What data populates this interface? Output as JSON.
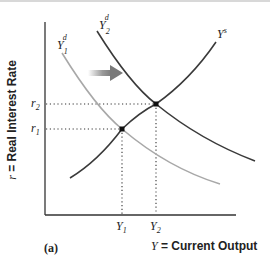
{
  "figure": {
    "panel_label": "(a)",
    "y_axis": {
      "symbol": "r",
      "label": " = Real Interest Rate"
    },
    "x_axis": {
      "symbol": "Y",
      "label": " = Current Output"
    }
  },
  "curves": {
    "supply": {
      "base": "Y",
      "sup": "s",
      "color": "#3a3a3a"
    },
    "demand_initial": {
      "base": "Y",
      "sub": "1",
      "sup": "d",
      "color": "#a8a8a8"
    },
    "demand_shifted": {
      "base": "Y",
      "sub": "2",
      "sup": "d",
      "color": "#3a3a3a"
    }
  },
  "shift_arrow": {
    "direction": "right",
    "color": "#8c8c8c"
  },
  "ticks": {
    "r2": {
      "base": "r",
      "sub": "2"
    },
    "r1": {
      "base": "r",
      "sub": "1"
    },
    "Y1": {
      "base": "Y",
      "sub": "1"
    },
    "Y2": {
      "base": "Y",
      "sub": "2"
    }
  },
  "equilibria": [
    {
      "name": "initial",
      "r": "r1",
      "Y": "Y1"
    },
    {
      "name": "new",
      "r": "r2",
      "Y": "Y2"
    }
  ]
}
